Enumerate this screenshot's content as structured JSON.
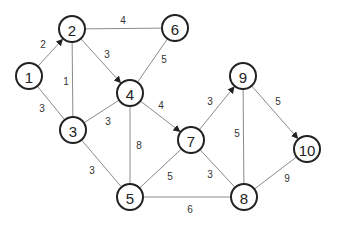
{
  "diagram": {
    "type": "weighted-graph",
    "nodes": [
      {
        "id": "1",
        "label": "1",
        "x": 29,
        "y": 76
      },
      {
        "id": "2",
        "label": "2",
        "x": 72,
        "y": 29
      },
      {
        "id": "3",
        "label": "3",
        "x": 73,
        "y": 130
      },
      {
        "id": "4",
        "label": "4",
        "x": 130,
        "y": 93
      },
      {
        "id": "5",
        "label": "5",
        "x": 130,
        "y": 197
      },
      {
        "id": "6",
        "label": "6",
        "x": 175,
        "y": 28
      },
      {
        "id": "7",
        "label": "7",
        "x": 191,
        "y": 140
      },
      {
        "id": "8",
        "label": "8",
        "x": 244,
        "y": 197
      },
      {
        "id": "9",
        "label": "9",
        "x": 243,
        "y": 76
      },
      {
        "id": "10",
        "label": "10",
        "x": 307,
        "y": 149
      }
    ],
    "edges": [
      {
        "from": "1",
        "to": "2",
        "weight": "2",
        "directed": true,
        "lx": 43,
        "ly": 44
      },
      {
        "from": "1",
        "to": "3",
        "weight": "3",
        "directed": false,
        "lx": 42,
        "ly": 108
      },
      {
        "from": "2",
        "to": "3",
        "weight": "1",
        "directed": false,
        "lx": 66,
        "ly": 81
      },
      {
        "from": "2",
        "to": "6",
        "weight": "4",
        "directed": false,
        "lx": 123,
        "ly": 20
      },
      {
        "from": "2",
        "to": "4",
        "weight": "3",
        "directed": true,
        "lx": 107,
        "ly": 54
      },
      {
        "from": "6",
        "to": "4",
        "weight": "5",
        "directed": false,
        "lx": 164,
        "ly": 59
      },
      {
        "from": "3",
        "to": "4",
        "weight": "3",
        "directed": false,
        "lx": 108,
        "ly": 121
      },
      {
        "from": "4",
        "to": "5",
        "weight": "8",
        "directed": false,
        "lx": 139,
        "ly": 145
      },
      {
        "from": "4",
        "to": "7",
        "weight": "4",
        "directed": true,
        "lx": 161,
        "ly": 105
      },
      {
        "from": "3",
        "to": "5",
        "weight": "3",
        "directed": false,
        "lx": 92,
        "ly": 170
      },
      {
        "from": "5",
        "to": "7",
        "weight": "5",
        "directed": false,
        "lx": 170,
        "ly": 176
      },
      {
        "from": "5",
        "to": "8",
        "weight": "6",
        "directed": false,
        "lx": 190,
        "ly": 209
      },
      {
        "from": "7",
        "to": "8",
        "weight": "3",
        "directed": false,
        "lx": 210,
        "ly": 174
      },
      {
        "from": "7",
        "to": "9",
        "weight": "3",
        "directed": true,
        "lx": 210,
        "ly": 101
      },
      {
        "from": "9",
        "to": "8",
        "weight": "5",
        "directed": false,
        "lx": 237,
        "ly": 133
      },
      {
        "from": "9",
        "to": "10",
        "weight": "5",
        "directed": true,
        "lx": 278,
        "ly": 101
      },
      {
        "from": "8",
        "to": "10",
        "weight": "9",
        "directed": false,
        "lx": 287,
        "ly": 178
      }
    ]
  },
  "colors": {
    "edge": "#8a8a8a",
    "node_stroke": "#222222",
    "node_fill": "#ffffff",
    "background": "#ffffff"
  }
}
